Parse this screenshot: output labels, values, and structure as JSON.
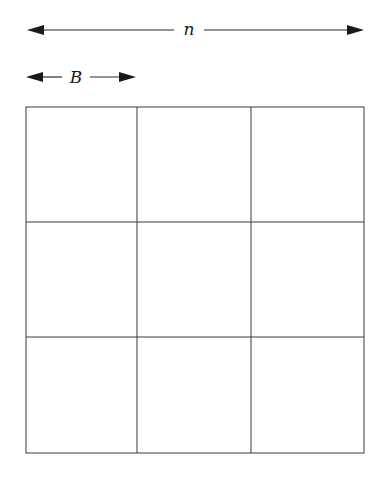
{
  "diagram": {
    "type": "blocked matrix",
    "width_label": "n",
    "block_label": "B",
    "grid": {
      "rows": 3,
      "cols": 3
    },
    "colors": {
      "stroke": "#2a2a2a",
      "background": "#ffffff"
    }
  }
}
